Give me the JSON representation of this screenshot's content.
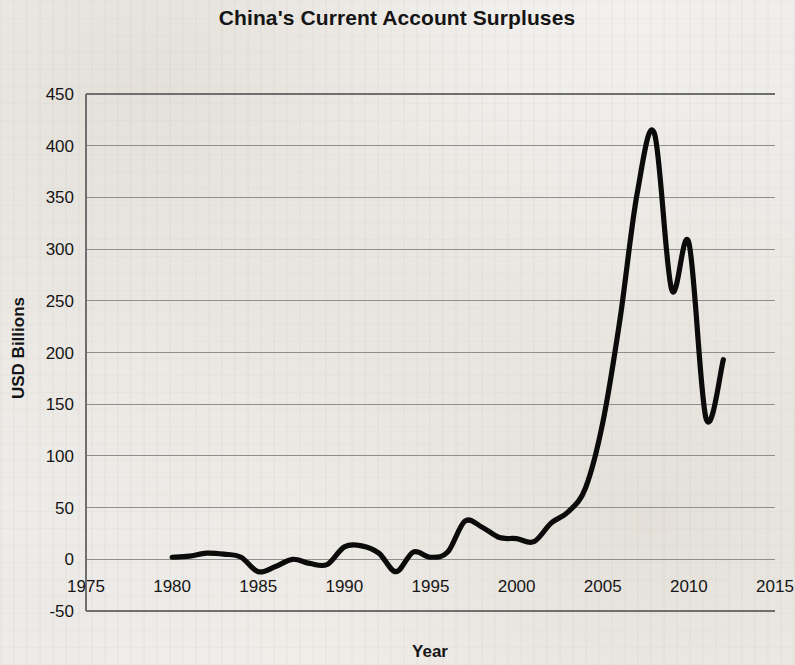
{
  "figure": {
    "background_color": "#f4f3f1",
    "line_color": "#0b0b0b",
    "grid_color": "#8e8e8e"
  },
  "chart_data": {
    "type": "line",
    "title": "China's Current Account Surpluses",
    "xlabel": "Year",
    "ylabel": "USD Billions",
    "xlim": [
      1975,
      2015
    ],
    "ylim": [
      -50,
      450
    ],
    "xticks": [
      1975,
      1980,
      1985,
      1990,
      1995,
      2000,
      2005,
      2010,
      2015
    ],
    "yticks": [
      -50,
      0,
      50,
      100,
      150,
      200,
      250,
      300,
      350,
      400,
      450
    ],
    "xtick_labels": [
      "1975",
      "1980",
      "1985",
      "1990",
      "1995",
      "2000",
      "2005",
      "2010",
      "2015"
    ],
    "ytick_labels": [
      "-50",
      "0",
      "50",
      "100",
      "150",
      "200",
      "250",
      "300",
      "350",
      "400",
      "450"
    ],
    "grid": true,
    "grid_axis": "y",
    "legend": "none",
    "series": [
      {
        "name": "Current account balance",
        "x": [
          1980,
          1981,
          1982,
          1983,
          1984,
          1985,
          1986,
          1987,
          1988,
          1989,
          1990,
          1991,
          1992,
          1993,
          1994,
          1995,
          1996,
          1997,
          1998,
          1999,
          2000,
          2001,
          2002,
          2003,
          2004,
          2005,
          2006,
          2007,
          2008,
          2009,
          2010,
          2011,
          2012
        ],
        "values": [
          2,
          3,
          6,
          5,
          2,
          -12,
          -7,
          0,
          -4,
          -5,
          12,
          13,
          6,
          -12,
          7,
          2,
          7,
          37,
          31,
          21,
          20,
          17,
          35,
          46,
          69,
          132,
          232,
          354,
          412,
          261,
          306,
          136,
          193
        ]
      }
    ]
  }
}
